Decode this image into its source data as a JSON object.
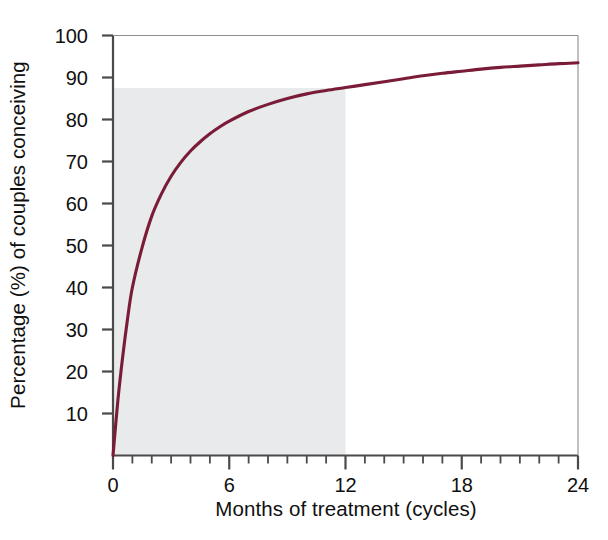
{
  "chart_data": {
    "type": "line",
    "title": "",
    "xlabel": "Months of treatment (cycles)",
    "ylabel": "Percentage (%) of couples conceiving",
    "xlim": [
      0,
      24
    ],
    "ylim": [
      0,
      100
    ],
    "xticks": [
      0,
      6,
      12,
      18,
      24
    ],
    "xtick_labels": [
      "0",
      "6",
      "12",
      "18",
      "24"
    ],
    "xminor_tick_interval": 1,
    "yticks": [
      10,
      20,
      30,
      40,
      50,
      60,
      70,
      80,
      90,
      100
    ],
    "ytick_labels": [
      "10",
      "20",
      "30",
      "40",
      "50",
      "60",
      "70",
      "80",
      "90",
      "100"
    ],
    "grid": false,
    "legend": null,
    "series": [
      {
        "name": "Cumulative percentage of couples conceiving",
        "color": "#7a1c38",
        "x": [
          0,
          0.25,
          0.5,
          0.75,
          1,
          1.5,
          2,
          2.5,
          3,
          3.5,
          4,
          4.5,
          5,
          5.5,
          6,
          7,
          8,
          9,
          10,
          11,
          12,
          13,
          14,
          15,
          16,
          17,
          18,
          19,
          20,
          21,
          22,
          23,
          24
        ],
        "values": [
          0,
          13,
          23.5,
          32.5,
          40,
          49.5,
          57,
          62.3,
          66.5,
          69.8,
          72.5,
          74.7,
          76.6,
          78.2,
          79.6,
          81.9,
          83.6,
          85,
          86.1,
          86.9,
          87.6,
          88.3,
          89,
          89.7,
          90.4,
          91,
          91.5,
          92,
          92.4,
          92.7,
          93,
          93.3,
          93.5
        ]
      }
    ],
    "shaded_region": {
      "name": "treatment-window-shading",
      "x_range": [
        0,
        12
      ],
      "y_range": [
        0,
        87.5
      ],
      "color": "#e8eaec"
    },
    "plateau_value": 93.5,
    "value_at_12_months": 87.5
  },
  "axes": {
    "frame_color": "#4a4a4a",
    "background": "#ffffff"
  }
}
